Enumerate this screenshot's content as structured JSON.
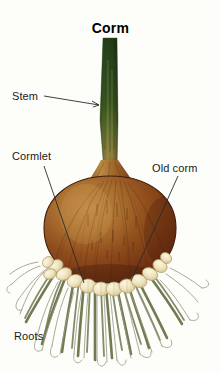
{
  "diagram": {
    "title": "Corm",
    "subject": "corm",
    "background_color": "#fdfdfa",
    "width": 221,
    "height": 372,
    "labels": [
      {
        "id": "stem",
        "text": "Stem",
        "x": 12,
        "y": 91,
        "leader": "horizontal-right"
      },
      {
        "id": "cormlet",
        "text": "Cormlet",
        "x": 12,
        "y": 151,
        "leader": "diagonal-down-right"
      },
      {
        "id": "oldcorm",
        "text": "Old corm",
        "x": 152,
        "y": 163,
        "leader": "diagonal-down-left"
      },
      {
        "id": "roots",
        "text": "Roots",
        "x": 14,
        "y": 331,
        "leader": "none"
      }
    ],
    "parts": [
      {
        "id": "stem",
        "name": "Stem",
        "color_top": "#2d4a1e",
        "color_mid": "#4a6b2a",
        "color_bottom": "#8a7a3c"
      },
      {
        "id": "corm",
        "name": "Old corm",
        "color_light": "#b8803c",
        "color_mid": "#8f4f1e",
        "color_dark": "#6a2f12"
      },
      {
        "id": "cormlets",
        "name": "Cormlet",
        "color_fill": "#efe6c4",
        "color_edge": "#b9a878"
      },
      {
        "id": "roots",
        "name": "Roots",
        "color_fill": "#6b7348",
        "color_thin": "#8d8f7a"
      }
    ],
    "leader_line_color": "#2b2b2b",
    "outline_color": "#4a2a14"
  }
}
